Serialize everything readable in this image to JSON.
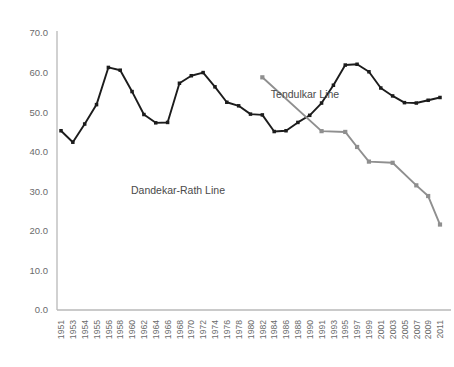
{
  "chart_data": {
    "type": "line",
    "title": "",
    "subtitle": "",
    "xlabel": "",
    "ylabel": "",
    "ylim": [
      0.0,
      70.0
    ],
    "yticks": [
      "0.0",
      "10.0",
      "20.0",
      "30.0",
      "40.0",
      "50.0",
      "60.0",
      "70.0"
    ],
    "ytick_values": [
      0,
      10,
      20,
      30,
      40,
      50,
      60,
      70
    ],
    "grid": false,
    "legend_position": "inline-annotation",
    "categories": [
      "1951",
      "1953",
      "1954",
      "1955",
      "1956",
      "1958",
      "1960",
      "1962",
      "1964",
      "1966",
      "1968",
      "1970",
      "1972",
      "1974",
      "1976",
      "1978",
      "1980",
      "1982",
      "1984",
      "1986",
      "1988",
      "1990",
      "1991",
      "1993",
      "1995",
      "1997",
      "1999",
      "2001",
      "2003",
      "2005",
      "2007",
      "2009",
      "2011"
    ],
    "series": [
      {
        "name": "Dandekar-Rath Line",
        "color": "#1c1c1c",
        "values": [
          45.3,
          42.4,
          47.0,
          51.9,
          61.3,
          60.6,
          55.2,
          49.4,
          47.3,
          47.4,
          57.3,
          59.2,
          60.0,
          56.4,
          52.5,
          51.6,
          49.5,
          49.3,
          45.1,
          45.3,
          47.4,
          49.2,
          52.3,
          56.8,
          61.9,
          62.1,
          60.2,
          56.1,
          54.1,
          52.4,
          52.3,
          53.0,
          53.7
        ]
      },
      {
        "name": "Tendulkar Line",
        "color": "#8f8f8f",
        "values": [
          null,
          null,
          null,
          null,
          null,
          null,
          null,
          null,
          null,
          null,
          null,
          null,
          null,
          null,
          null,
          null,
          null,
          58.8,
          null,
          null,
          null,
          null,
          45.2,
          null,
          45.0,
          41.2,
          37.5,
          null,
          37.2,
          null,
          31.5,
          28.8,
          21.6
        ]
      }
    ],
    "dandekar_points": [
      {
        "x": "1951",
        "y": 45.3
      },
      {
        "x": "1953",
        "y": 42.4
      },
      {
        "x": "1954",
        "y": 47.0
      },
      {
        "x": "1955",
        "y": 51.9
      },
      {
        "x": "1956",
        "y": 61.3
      },
      {
        "x": "1958",
        "y": 60.5
      },
      {
        "x": "1960",
        "y": 55.2
      },
      {
        "x": "1962",
        "y": 49.4
      },
      {
        "x": "1964",
        "y": 47.3
      },
      {
        "x": "1966",
        "y": 47.5
      },
      {
        "x": "1968",
        "y": 57.3
      },
      {
        "x": "1970",
        "y": 59.9
      },
      {
        "x": "1972",
        "y": 56.4
      },
      {
        "x": "1974",
        "y": 52.6
      },
      {
        "x": "1976",
        "y": 51.6
      },
      {
        "x": "1978",
        "y": 49.5
      },
      {
        "x": "1980",
        "y": 49.4
      },
      {
        "x": "1982",
        "y": 45.1
      },
      {
        "x": "1984",
        "y": 45.4
      },
      {
        "x": "1986",
        "y": 47.4
      },
      {
        "x": "1988",
        "y": 49.2
      },
      {
        "x": "1990",
        "y": 52.4
      },
      {
        "x": "1991",
        "y": 56.8
      },
      {
        "x": "1993",
        "y": 61.9
      },
      {
        "x": "1995",
        "y": 62.1
      },
      {
        "x": "1997",
        "y": 60.2
      },
      {
        "x": "1999",
        "y": 56.1
      },
      {
        "x": "2001",
        "y": 54.1
      },
      {
        "x": "2003",
        "y": 52.4
      },
      {
        "x": "2005",
        "y": 52.4
      },
      {
        "x": "2007",
        "y": 53.0
      },
      {
        "x": "2009",
        "y": 53.7
      },
      {
        "x": "2011",
        "y": 48.8
      }
    ],
    "annotations": [
      {
        "text": "Tendulkar Line",
        "x_px": 305,
        "y_px": 98
      },
      {
        "text": "Dandekar-Rath Line",
        "x_px": 178,
        "y_px": 194
      }
    ],
    "axis_color": "#b9b9b9",
    "marker_shape": "square"
  },
  "series_labels": {
    "dandekar": "Dandekar-Rath Line",
    "tendulkar": "Tendulkar Line"
  }
}
